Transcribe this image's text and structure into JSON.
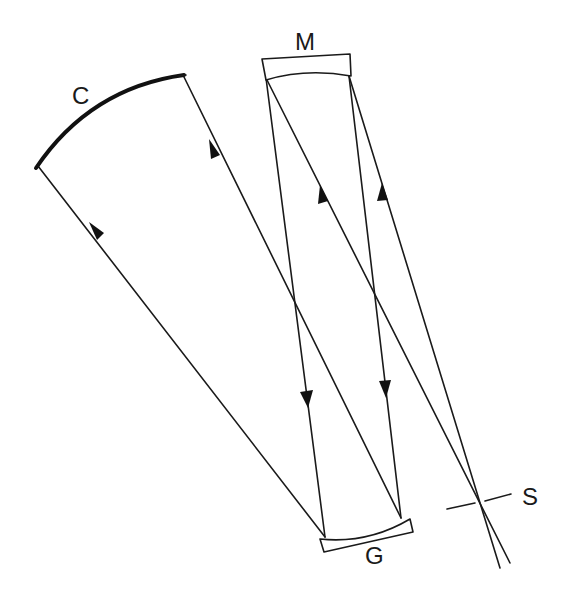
{
  "diagram": {
    "type": "optical-ray-diagram",
    "labels": {
      "collimator_mirror": "C",
      "camera_mirror": "M",
      "grating": "G",
      "slit": "S"
    },
    "colors": {
      "line": "#1a1a1a",
      "background": "#ffffff"
    },
    "rays": [
      {
        "from": "G-left",
        "to": "C-left",
        "arrow_direction": "toward C"
      },
      {
        "from": "G-right",
        "to": "C-right",
        "arrow_direction": "toward C"
      },
      {
        "from": "M-left",
        "to": "G-left",
        "arrow_direction": "toward G"
      },
      {
        "from": "M-right",
        "to": "G-right",
        "arrow_direction": "toward G"
      },
      {
        "from": "S",
        "to": "M-left",
        "arrow_direction": "toward M"
      },
      {
        "from": "S",
        "to": "M-right",
        "arrow_direction": "toward M"
      }
    ]
  }
}
